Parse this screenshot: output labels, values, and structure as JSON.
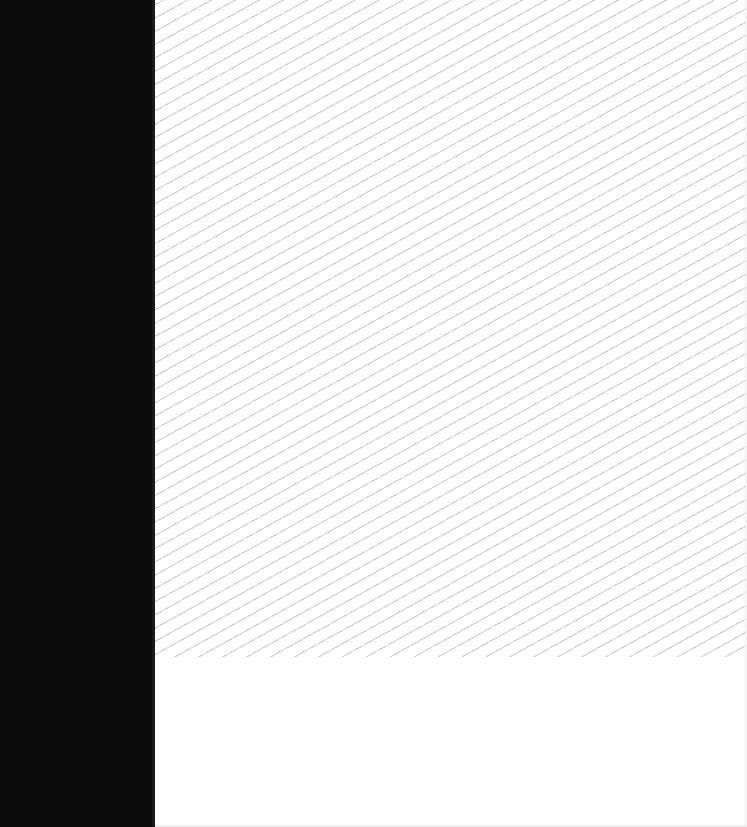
{
  "layout": {
    "left_panel": {
      "color": "#0b0b0b",
      "width_px": 155
    },
    "content": {
      "background": "#ffffff",
      "pattern": {
        "type": "diagonal-stripes",
        "stripe_color": "#d2d2d2",
        "end_y_px": 657
      }
    }
  },
  "text": {}
}
